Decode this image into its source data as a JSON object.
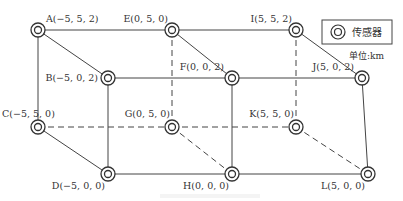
{
  "legend": {
    "symbol": "sensor-icon",
    "label": "传感器",
    "unit": "单位:km"
  },
  "nodes": [
    {
      "id": "A",
      "label": "A(−5, 5, 2)",
      "x": 38,
      "y": 30
    },
    {
      "id": "E",
      "label": "E(0, 5, 0)",
      "x": 172,
      "y": 30
    },
    {
      "id": "I",
      "label": "I(5, 5, 2)",
      "x": 296,
      "y": 30
    },
    {
      "id": "B",
      "label": "B(−5, 0, 2)",
      "x": 108,
      "y": 78
    },
    {
      "id": "F",
      "label": "F(0, 0, 2)",
      "x": 232,
      "y": 78
    },
    {
      "id": "J",
      "label": "J(5, 0, 2)",
      "x": 362,
      "y": 78
    },
    {
      "id": "C",
      "label": "C(−5, 5, 0)",
      "x": 38,
      "y": 127
    },
    {
      "id": "G",
      "label": "G(0, 5, 0)",
      "x": 172,
      "y": 127
    },
    {
      "id": "K",
      "label": "K(5, 5, 0)",
      "x": 296,
      "y": 127
    },
    {
      "id": "D",
      "label": "D(−5, 0, 0)",
      "x": 108,
      "y": 174
    },
    {
      "id": "H",
      "label": "H(0, 0, 0)",
      "x": 232,
      "y": 174
    },
    {
      "id": "L",
      "label": "L(5, 0, 0)",
      "x": 368,
      "y": 174
    }
  ],
  "edges_solid": [
    [
      "A",
      "E"
    ],
    [
      "E",
      "I"
    ],
    [
      "B",
      "F"
    ],
    [
      "F",
      "J"
    ],
    [
      "D",
      "H"
    ],
    [
      "H",
      "L"
    ],
    [
      "A",
      "B"
    ],
    [
      "E",
      "F"
    ],
    [
      "I",
      "J"
    ],
    [
      "C",
      "D"
    ],
    [
      "A",
      "C"
    ],
    [
      "B",
      "D"
    ],
    [
      "F",
      "H"
    ],
    [
      "J",
      "L"
    ]
  ],
  "edges_dashed": [
    [
      "C",
      "G"
    ],
    [
      "G",
      "K"
    ],
    [
      "E",
      "G"
    ],
    [
      "I",
      "K"
    ],
    [
      "G",
      "H"
    ],
    [
      "K",
      "L"
    ]
  ],
  "caption": ""
}
